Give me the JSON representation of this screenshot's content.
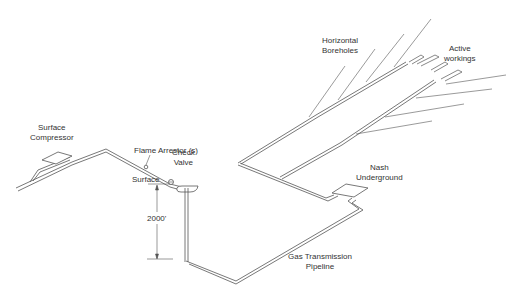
{
  "diagram": {
    "type": "mine methane drainage schematic",
    "stroke_color": "#555555",
    "background": "#ffffff",
    "labels": {
      "surface_compressor": [
        "Surface",
        "Compressor"
      ],
      "flame_arrestor": "Flame Arrestor (s)",
      "check_valve": [
        "Check",
        "Valve"
      ],
      "surface": "Surface",
      "depth": "2000'",
      "horizontal_boreholes": [
        "Horizontal",
        "Boreholes"
      ],
      "active_workings": [
        "Active",
        "workings"
      ],
      "nash_underground": [
        "Nash",
        "Underground"
      ],
      "gas_transmission_pipeline": [
        "Gas Transmission",
        "Pipeline"
      ]
    },
    "components": [
      "surface-compressor",
      "flame-arrestor",
      "check-valve",
      "vertical-shaft-pipe",
      "gas-transmission-pipeline",
      "nash-underground-pump",
      "horizontal-boreholes",
      "active-workings"
    ]
  }
}
